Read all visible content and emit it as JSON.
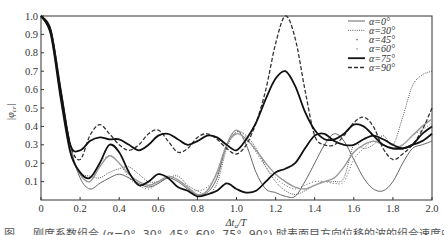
{
  "chart_data": {
    "type": "line",
    "title": "",
    "xlabel": "Δt_a/T",
    "ylabel": "|φcr|",
    "xlim": [
      0,
      2.0
    ],
    "ylim": [
      0,
      1.0
    ],
    "grid": false,
    "legend_position": "upper right",
    "x_ticks": [
      "0",
      "0.2",
      "0.4",
      "0.6",
      "0.8",
      "1.0",
      "1.2",
      "1.4",
      "1.6",
      "1.8",
      "2.0"
    ],
    "y_ticks": [
      "0.1",
      "0.2",
      "0.3",
      "0.4",
      "0.5",
      "0.6",
      "0.7",
      "0.8",
      "0.9",
      "1.0"
    ],
    "x": [
      0,
      0.05,
      0.1,
      0.15,
      0.2,
      0.25,
      0.3,
      0.35,
      0.4,
      0.45,
      0.5,
      0.55,
      0.6,
      0.65,
      0.7,
      0.75,
      0.8,
      0.85,
      0.9,
      0.95,
      1.0,
      1.05,
      1.1,
      1.15,
      1.2,
      1.25,
      1.3,
      1.35,
      1.4,
      1.45,
      1.5,
      1.55,
      1.6,
      1.65,
      1.7,
      1.75,
      1.8,
      1.85,
      1.9,
      1.95,
      2.0
    ],
    "series": [
      {
        "name": "α=0°",
        "style": "solid-thin",
        "color": "#555555",
        "values": [
          1.0,
          0.93,
          0.62,
          0.3,
          0.12,
          0.06,
          0.09,
          0.12,
          0.14,
          0.12,
          0.09,
          0.07,
          0.09,
          0.12,
          0.1,
          0.06,
          0.03,
          0.04,
          0.12,
          0.3,
          0.38,
          0.3,
          0.15,
          0.06,
          0.04,
          0.02,
          0.02,
          0.1,
          0.2,
          0.3,
          0.36,
          0.32,
          0.22,
          0.12,
          0.06,
          0.05,
          0.1,
          0.2,
          0.28,
          0.3,
          0.32
        ]
      },
      {
        "name": "α=30°",
        "style": "dotted",
        "color": "#444444",
        "values": [
          1.0,
          0.92,
          0.6,
          0.28,
          0.15,
          0.13,
          0.12,
          0.15,
          0.17,
          0.18,
          0.14,
          0.1,
          0.1,
          0.12,
          0.13,
          0.08,
          0.05,
          0.03,
          0.09,
          0.28,
          0.37,
          0.35,
          0.28,
          0.18,
          0.1,
          0.05,
          0.03,
          0.05,
          0.08,
          0.1,
          0.1,
          0.12,
          0.3,
          0.28,
          0.3,
          0.35,
          0.3,
          0.45,
          0.62,
          0.68,
          0.7
        ]
      },
      {
        "name": "α=45°",
        "style": "sparse-dot",
        "color": "#666666",
        "values": [
          1.0,
          0.9,
          0.58,
          0.28,
          0.14,
          0.1,
          0.2,
          0.24,
          0.2,
          0.12,
          0.08,
          0.06,
          0.09,
          0.12,
          0.11,
          0.06,
          0.05,
          0.07,
          0.14,
          0.3,
          0.37,
          0.34,
          0.26,
          0.18,
          0.12,
          0.08,
          0.06,
          0.08,
          0.1,
          0.1,
          0.09,
          0.1,
          0.22,
          0.28,
          0.32,
          0.3,
          0.28,
          0.3,
          0.35,
          0.38,
          0.42
        ]
      },
      {
        "name": "α=60°",
        "style": "gray-solid",
        "color": "#999999",
        "values": [
          1.0,
          0.9,
          0.57,
          0.27,
          0.14,
          0.1,
          0.18,
          0.24,
          0.2,
          0.14,
          0.1,
          0.08,
          0.1,
          0.13,
          0.11,
          0.07,
          0.03,
          0.05,
          0.15,
          0.3,
          0.36,
          0.33,
          0.27,
          0.2,
          0.14,
          0.1,
          0.07,
          0.06,
          0.08,
          0.1,
          0.12,
          0.18,
          0.26,
          0.3,
          0.32,
          0.3,
          0.28,
          0.3,
          0.35,
          0.4,
          0.44
        ]
      },
      {
        "name": "α=75°",
        "style": "solid-thick",
        "color": "#111111",
        "values": [
          1.0,
          0.9,
          0.56,
          0.26,
          0.15,
          0.12,
          0.2,
          0.3,
          0.26,
          0.15,
          0.08,
          0.1,
          0.14,
          0.12,
          0.07,
          0.05,
          0.02,
          0.03,
          0.05,
          0.09,
          0.06,
          0.04,
          0.05,
          0.1,
          0.15,
          0.17,
          0.2,
          0.28,
          0.35,
          0.36,
          0.32,
          0.3,
          0.3,
          0.33,
          0.35,
          0.33,
          0.3,
          0.28,
          0.3,
          0.32,
          0.36
        ]
      },
      {
        "name": "α=90°",
        "style": "dashed",
        "color": "#333333",
        "values": [
          1.0,
          0.92,
          0.6,
          0.3,
          0.22,
          0.35,
          0.41,
          0.36,
          0.3,
          0.27,
          0.3,
          0.36,
          0.38,
          0.32,
          0.26,
          0.28,
          0.34,
          0.36,
          0.33,
          0.28,
          0.25,
          0.3,
          0.42,
          0.6,
          0.85,
          1.0,
          0.88,
          0.6,
          0.35,
          0.3,
          0.3,
          0.35,
          0.42,
          0.45,
          0.4,
          0.28,
          0.22,
          0.25,
          0.3,
          0.38,
          0.5
        ]
      },
      {
        "name": "α=75° (upper branch)",
        "style": "solid-thick",
        "color": "#222222",
        "values": [
          1.0,
          0.92,
          0.6,
          0.3,
          0.27,
          0.32,
          0.34,
          0.33,
          0.33,
          0.3,
          0.27,
          0.3,
          0.35,
          0.36,
          0.33,
          0.3,
          0.32,
          0.35,
          0.34,
          0.3,
          0.27,
          0.33,
          0.42,
          0.55,
          0.66,
          0.7,
          0.62,
          0.48,
          0.38,
          0.33,
          0.33,
          0.36,
          0.41,
          0.4,
          0.35,
          0.3,
          0.28,
          0.28,
          0.3,
          0.36,
          0.4
        ]
      }
    ]
  },
  "legend": {
    "items": [
      {
        "label": "α=0°",
        "style": "solid-thin"
      },
      {
        "label": "α=30°",
        "style": "dotted"
      },
      {
        "label": "α=45°",
        "style": "sparse-dot"
      },
      {
        "label": "α=60°",
        "style": "gray-dot"
      },
      {
        "label": "α=75°",
        "style": "solid-thick"
      },
      {
        "label": "α=90°",
        "style": "dashed"
      }
    ]
  },
  "axes": {
    "xlabel_main": "Δt",
    "xlabel_sub": "a",
    "xlabel_tail": "/T",
    "ylabel_main": "|φ",
    "ylabel_sub": "cr",
    "ylabel_tail": "|"
  },
  "caption": {
    "text": "图 … 刚度系数组合 (α=0°, 30°, 45°, 60°, 75°, 90°) 时表面目方向位移的波的组合速度曲线比较"
  }
}
